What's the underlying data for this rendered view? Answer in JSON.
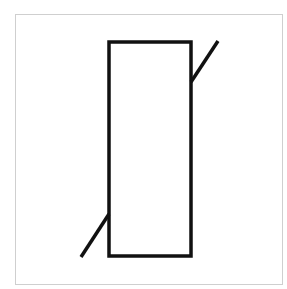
{
  "diagram": {
    "symbol": "varistor-resistor-symbol",
    "frame": {
      "x": 15,
      "y": 14,
      "width": 267,
      "height": 270,
      "stroke": "#cfcfcf",
      "stroke_width": 1
    },
    "body_rect": {
      "x": 109,
      "y": 42,
      "width": 82,
      "height": 214,
      "stroke": "#111111",
      "stroke_width": 3.5,
      "fill": "#ffffff"
    },
    "diagonal_segments": [
      {
        "x1": 218,
        "y1": 41,
        "x2": 191,
        "y2": 82
      },
      {
        "x1": 109,
        "y1": 214,
        "x2": 81,
        "y2": 257
      }
    ],
    "line_color": "#111111",
    "background": "#ffffff"
  }
}
